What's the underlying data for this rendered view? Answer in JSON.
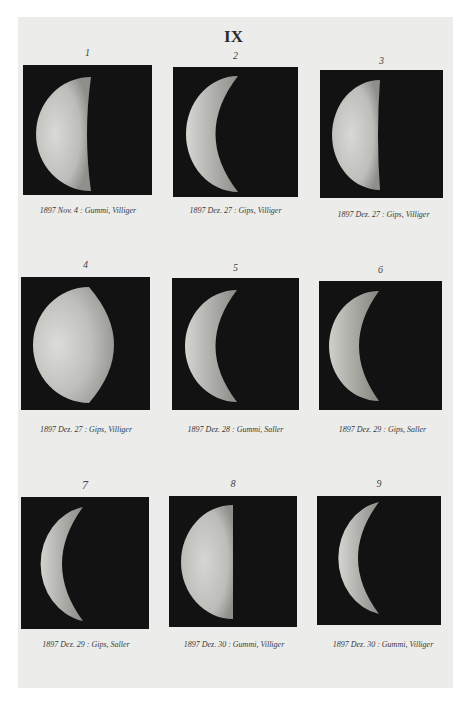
{
  "plate": {
    "title": "IX",
    "background_color": "#ececea",
    "panel_color": "#121212"
  },
  "figures": [
    {
      "number": "1",
      "caption": "1897 Nov. 4 : Gummi, Villiger",
      "phase": "gibbous-half",
      "x": 23,
      "y": 65,
      "w": 129,
      "h": 130
    },
    {
      "number": "2",
      "caption": "1897 Dez. 27 : Gips, Villiger",
      "phase": "crescent",
      "x": 173,
      "y": 67,
      "w": 125,
      "h": 130
    },
    {
      "number": "3",
      "caption": "1897 Dez. 27 : Gips, Villiger",
      "phase": "half",
      "x": 320,
      "y": 70,
      "w": 123,
      "h": 128
    },
    {
      "number": "4",
      "caption": "1897 Dez. 27 : Gips, Villiger",
      "phase": "gibbous",
      "x": 21,
      "y": 277,
      "w": 129,
      "h": 133
    },
    {
      "number": "5",
      "caption": "1897 Dez. 28 : Gummi, Saller",
      "phase": "crescent",
      "x": 172,
      "y": 278,
      "w": 127,
      "h": 132
    },
    {
      "number": "6",
      "caption": "1897 Dez. 29 : Gips, Saller",
      "phase": "crescent",
      "x": 319,
      "y": 281,
      "w": 123,
      "h": 129
    },
    {
      "number": "7",
      "caption": "1897 Dez. 29 : Gips, Saller",
      "phase": "thin-crescent",
      "x": 21,
      "y": 497,
      "w": 128,
      "h": 132
    },
    {
      "number": "8",
      "caption": "1897 Dez. 30 : Gummi, Villiger",
      "phase": "half",
      "x": 169,
      "y": 496,
      "w": 128,
      "h": 131
    },
    {
      "number": "9",
      "caption": "1897 Dez. 30 : Gummi, Villiger",
      "phase": "thin-crescent",
      "x": 317,
      "y": 496,
      "w": 124,
      "h": 129
    }
  ]
}
